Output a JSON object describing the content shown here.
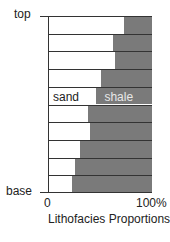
{
  "chart_data": {
    "type": "bar",
    "orientation": "horizontal-stacked-100",
    "title": "",
    "xlabel": "Lithofacies Proportions",
    "ylabel": "",
    "y_tick_labels": {
      "top": "top",
      "base": "base"
    },
    "x_tick_labels": [
      "0",
      "100%"
    ],
    "xlim": [
      0,
      100
    ],
    "categories": [
      "row1 (top)",
      "row2",
      "row3",
      "row4",
      "row5",
      "row6",
      "row7",
      "row8",
      "row9",
      "row10 (base)"
    ],
    "series": [
      {
        "name": "sand",
        "color": "#ffffff",
        "values": [
          73,
          62,
          64,
          50,
          46,
          38,
          40,
          30,
          25,
          22
        ]
      },
      {
        "name": "shale",
        "color": "#7a7a7a",
        "values": [
          27,
          38,
          36,
          50,
          54,
          62,
          60,
          70,
          75,
          78
        ]
      }
    ],
    "annotations": [
      {
        "text": "sand",
        "row": 5
      },
      {
        "text": "shale",
        "row": 5
      }
    ],
    "grid": false,
    "legend": "inline labels"
  },
  "labels": {
    "top": "top",
    "base": "base",
    "x0": "0",
    "x100": "100%",
    "xlabel": "Lithofacies Proportions",
    "sand": "sand",
    "shale": "shale"
  }
}
